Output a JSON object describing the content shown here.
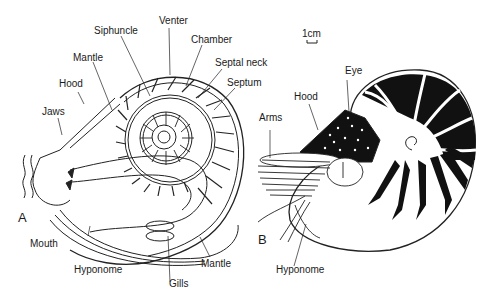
{
  "figure": {
    "panels": [
      {
        "id": "A",
        "label": "A",
        "title": "Nautilus shell cross-section (internal anatomy)"
      },
      {
        "id": "B",
        "label": "B",
        "title": "Nautilus external view"
      }
    ],
    "scale_bar": {
      "label": "1cm"
    },
    "panel_a_labels": {
      "siphuncle": "Siphuncle",
      "venter": "Venter",
      "chamber": "Chamber",
      "septal_neck": "Septal neck",
      "septum": "Septum",
      "mantle_top": "Mantle",
      "hood": "Hood",
      "jaws": "Jaws",
      "mouth": "Mouth",
      "hyponome": "Hyponome",
      "gills": "Gills",
      "mantle_bottom": "Mantle"
    },
    "panel_b_labels": {
      "eye": "Eye",
      "hood": "Hood",
      "arms": "Arms",
      "hyponome": "Hyponome"
    }
  }
}
